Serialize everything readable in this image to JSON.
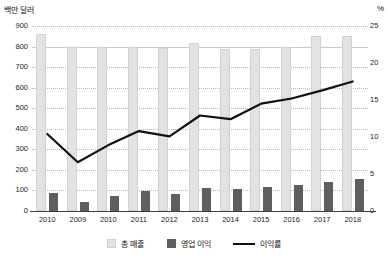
{
  "chart_data": {
    "type": "bar",
    "title": "",
    "categories": [
      "2010",
      "2009",
      "2010",
      "2011",
      "2012",
      "2013",
      "2014",
      "2015",
      "2016",
      "2017",
      "2018"
    ],
    "ylabel": "백만 달러",
    "y2label": "%",
    "ylim": [
      0,
      900
    ],
    "y2lim": [
      0,
      25
    ],
    "yticks": [
      "0",
      "100",
      "200",
      "300",
      "400",
      "500",
      "600",
      "700",
      "800",
      "900"
    ],
    "y2ticks": [
      "0",
      "5",
      "10",
      "15",
      "20",
      "25"
    ],
    "grid": true,
    "legend_position": "bottom",
    "series": [
      {
        "name": "총 매출",
        "type": "bar",
        "axis": "left",
        "color": "#e2e2e2",
        "values": [
          862,
          800,
          798,
          797,
          795,
          818,
          786,
          788,
          798,
          852,
          850
        ]
      },
      {
        "name": "영업 이익",
        "type": "bar",
        "axis": "left",
        "color": "#5e5e5e",
        "values": [
          90,
          45,
          75,
          95,
          85,
          110,
          108,
          115,
          125,
          140,
          155
        ]
      },
      {
        "name": "이익률",
        "type": "line",
        "axis": "right",
        "color": "#111111",
        "values": [
          10.4,
          6.6,
          8.9,
          10.8,
          10.1,
          12.9,
          12.4,
          14.5,
          15.2,
          16.3,
          17.5
        ]
      }
    ]
  },
  "legend": {
    "items": [
      {
        "label": "총 매출",
        "swatch": "revenue-swatch"
      },
      {
        "label": "영업 이익",
        "swatch": "profit-swatch"
      },
      {
        "label": "이익률",
        "swatch": "rate-line-swatch"
      }
    ]
  }
}
